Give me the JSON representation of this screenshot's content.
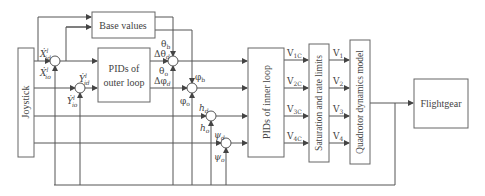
{
  "blocks": {
    "joystick": "Joystick",
    "base_values": "Base values",
    "outer_loop_line1": "PIDs of",
    "outer_loop_line2": "outer loop",
    "inner_loop": "PIDs of inner loop",
    "saturation": "Saturation and rate limits",
    "quadrotor": "Quadrotor dynamics model",
    "flightgear": "Flightgear"
  },
  "signals": {
    "x_d": "Ẋ",
    "x_d_sup": "l",
    "x_d_sub": "id",
    "x_o": "Ẋ",
    "x_o_sup": "l",
    "x_o_sub": "io",
    "y_d": "Ẏ",
    "y_d_sup": "l",
    "y_d_sub": "id",
    "y_o": "Ẏ",
    "y_o_sup": "l",
    "y_o_sub": "io",
    "theta_b": "θ",
    "theta_b_sub": "b",
    "dtheta_d": "Δθ",
    "dtheta_d_sub": "d",
    "theta_o": "θ",
    "theta_o_sub": "o",
    "dphi_d": "Δφ",
    "dphi_d_sub": "d",
    "phi_b": "φ",
    "phi_b_sub": "b",
    "phi_o": "φ",
    "phi_o_sub": "o",
    "h_d": "h",
    "h_d_sub": "d",
    "h_o": "h",
    "h_o_sub": "o",
    "psi_d": "ψ",
    "psi_d_sub": "d",
    "psi_o": "ψ",
    "psi_o_sub": "o"
  },
  "commands": [
    {
      "main": "V",
      "sub": "1C"
    },
    {
      "main": "V",
      "sub": "2C"
    },
    {
      "main": "V",
      "sub": "3C"
    },
    {
      "main": "V",
      "sub": "4C"
    }
  ],
  "outputs": [
    {
      "main": "V",
      "sub": "1"
    },
    {
      "main": "V",
      "sub": "2"
    },
    {
      "main": "V",
      "sub": "3"
    },
    {
      "main": "V",
      "sub": "4"
    }
  ],
  "colors": {
    "line": "#555555",
    "box": "#666666",
    "text": "#444444"
  }
}
